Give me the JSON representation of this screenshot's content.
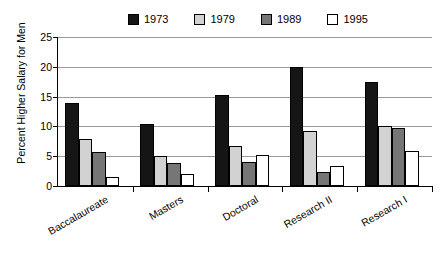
{
  "chart_data": {
    "type": "bar",
    "title": "",
    "xlabel": "",
    "ylabel": "Percent  Higher Salary for Men",
    "categories": [
      "Baccalaureate",
      "Masters",
      "Doctoral",
      "Research II",
      "Research I"
    ],
    "series": [
      {
        "name": "1973",
        "color": "#151515",
        "values": [
          13.9,
          10.4,
          15.2,
          20.0,
          17.5
        ]
      },
      {
        "name": "1979",
        "color": "#d2d2d2",
        "values": [
          7.9,
          5.0,
          6.7,
          9.3,
          10.1
        ]
      },
      {
        "name": "1989",
        "color": "#767676",
        "values": [
          5.7,
          3.9,
          4.1,
          2.4,
          9.8
        ]
      },
      {
        "name": "1995",
        "color": "#ffffff",
        "values": [
          1.5,
          2.0,
          5.2,
          3.4,
          5.9
        ]
      }
    ],
    "ylim": [
      0,
      25
    ],
    "yticks": [
      0,
      5,
      10,
      15,
      20,
      25
    ],
    "ytick_labels": [
      "0",
      "5",
      "10",
      "15",
      "20",
      "25"
    ],
    "grid": true,
    "legend_position": "top"
  }
}
